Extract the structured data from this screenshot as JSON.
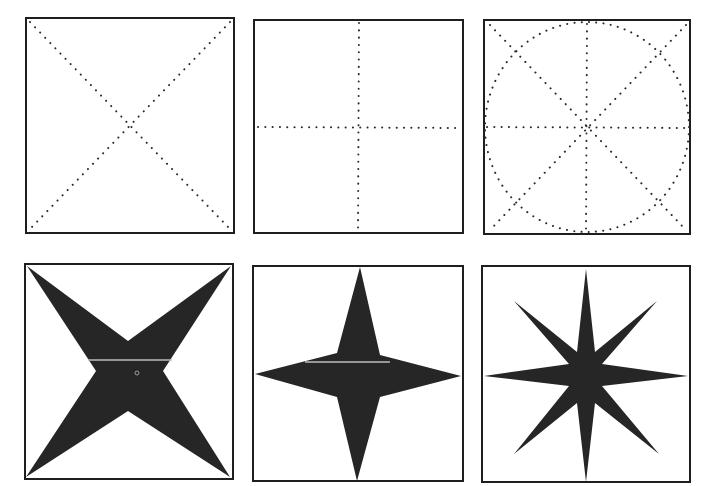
{
  "figure": {
    "colors": {
      "background": "#ffffff",
      "ink": "#262626",
      "frame": "#1e1e1e"
    },
    "panels": [
      {
        "id": "guide-diagonals",
        "row": 1,
        "col": 1,
        "type": "guide",
        "guides": [
          "diagonal-cross"
        ],
        "box": [
          26,
          18,
          208,
          215
        ]
      },
      {
        "id": "guide-axes",
        "row": 1,
        "col": 2,
        "type": "guide",
        "guides": [
          "vertical",
          "horizontal"
        ],
        "box": [
          254,
          20,
          209,
          213
        ]
      },
      {
        "id": "guide-circle-eight",
        "row": 1,
        "col": 3,
        "type": "guide",
        "guides": [
          "diagonal-cross",
          "vertical",
          "horizontal",
          "inscribed-circle"
        ],
        "box": [
          484,
          20,
          206,
          214
        ]
      },
      {
        "id": "star-four-diagonal",
        "row": 2,
        "col": 1,
        "type": "star",
        "points": 4,
        "orientation": "diagonal",
        "box": [
          25,
          264,
          208,
          215
        ]
      },
      {
        "id": "star-four-axis",
        "row": 2,
        "col": 2,
        "type": "star",
        "points": 4,
        "orientation": "axis",
        "box": [
          253,
          266,
          210,
          215
        ]
      },
      {
        "id": "star-eight",
        "row": 2,
        "col": 3,
        "type": "star",
        "points": 8,
        "orientation": "compass",
        "box": [
          482,
          266,
          208,
          216
        ]
      }
    ]
  }
}
